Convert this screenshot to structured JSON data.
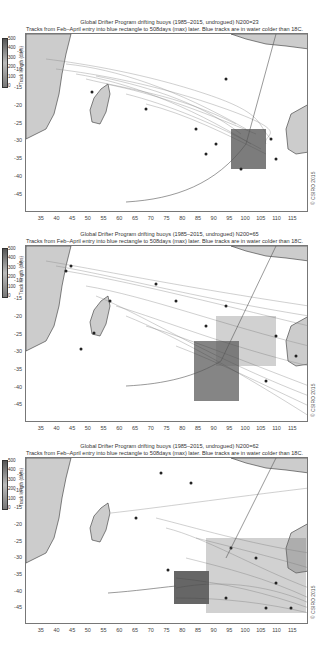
{
  "figure": {
    "copyright": "© CSIRO 2015",
    "colorbar": {
      "label": "Track length (days)",
      "ticks": [
        "500",
        "400",
        "300",
        "200",
        "100",
        "0"
      ]
    },
    "x_ticks": [
      "35",
      "40",
      "45",
      "50",
      "55",
      "60",
      "65",
      "70",
      "75",
      "80",
      "85",
      "90",
      "95",
      "100",
      "105",
      "110",
      "115"
    ],
    "y_ticks": [
      "-5",
      "-10",
      "-15",
      "-20",
      "-25",
      "-30",
      "-35",
      "-40",
      "-45"
    ],
    "panels": [
      {
        "title": "Global Drifter Program drifting buoys (1985–2015, undrogued) N200=23",
        "subtitle": "Tracks from Feb–April entry into blue rectangle to 508days (max) later. Blue tracks are in water colder than 18C."
      },
      {
        "title": "Global Drifter Program drifting buoys (1985–2015, undrogued) N200=65",
        "subtitle": "Tracks from Feb–April entry into blue rectangle to 508days (max) later. Blue tracks are in water colder than 18C."
      },
      {
        "title": "Global Drifter Program drifting buoys (1985–2015, undrogued) N200=62",
        "subtitle": "Tracks from Feb–April entry into blue rectangle to 508days (max) later. Blue tracks are in water colder than 18C."
      }
    ]
  },
  "chart_data": [
    {
      "type": "scatter",
      "title": "Global Drifter Program drifting buoys (1985–2015, undrogued) N200=23",
      "xlabel": "Longitude",
      "ylabel": "Latitude",
      "xlim": [
        30,
        120
      ],
      "ylim": [
        -50,
        0
      ],
      "release_box": {
        "lon": [
          95,
          102
        ],
        "lat": [
          -33,
          -26
        ]
      },
      "n_tracks": 23
    },
    {
      "type": "scatter",
      "title": "Global Drifter Program drifting buoys (1985–2015, undrogued) N200=65",
      "xlabel": "Longitude",
      "ylabel": "Latitude",
      "xlim": [
        30,
        120
      ],
      "ylim": [
        -50,
        0
      ],
      "release_box": {
        "lon": [
          86,
          93
        ],
        "lat": [
          -40,
          -33
        ]
      },
      "n_tracks": 65
    },
    {
      "type": "scatter",
      "title": "Global Drifter Program drifting buoys (1985–2015, undrogued) N200=62",
      "xlabel": "Longitude",
      "ylabel": "Latitude",
      "xlim": [
        30,
        120
      ],
      "ylim": [
        -50,
        0
      ],
      "release_box": {
        "lon": [
          77,
          85
        ],
        "lat": [
          -47,
          -40
        ]
      },
      "n_tracks": 62
    }
  ]
}
